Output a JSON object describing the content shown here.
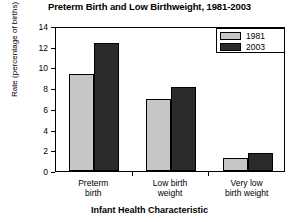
{
  "chart_data": {
    "type": "bar",
    "title": "Preterm Birth and Low Birthweight, 1981-2003",
    "xlabel": "Infant Health Characteristic",
    "ylabel": "Rate (percentage of births)",
    "categories": [
      "Preterm birth",
      "Low birth weight",
      "Very low birth weight"
    ],
    "category_lines": [
      [
        "Preterm",
        "birth"
      ],
      [
        "Low birth",
        "weight"
      ],
      [
        "Very low",
        "birth weight"
      ]
    ],
    "series": [
      {
        "name": "1981",
        "values": [
          9.4,
          7.0,
          1.3
        ],
        "color": "#c6c6c6"
      },
      {
        "name": "2003",
        "values": [
          12.4,
          8.1,
          1.7
        ],
        "color": "#2b2b2b"
      }
    ],
    "ylim": [
      0,
      14
    ],
    "yticks": [
      0,
      2,
      4,
      6,
      8,
      10,
      12,
      14
    ],
    "ytick_labels": [
      "0",
      "2",
      "4",
      "6",
      "8",
      "10",
      "12",
      "14"
    ],
    "grid": false,
    "legend_position": "top-right",
    "legend_entries": [
      "1981",
      "2003"
    ]
  }
}
